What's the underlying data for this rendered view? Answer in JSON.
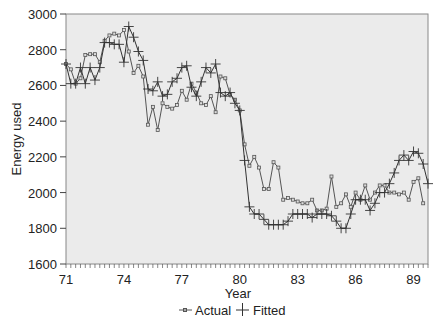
{
  "chart_data": {
    "type": "line",
    "title": "",
    "xlabel": "Year",
    "ylabel": "Energy used",
    "xlim": [
      71,
      89.75
    ],
    "ylim": [
      1600,
      3000
    ],
    "x_ticks": [
      "71",
      "74",
      "77",
      "80",
      "83",
      "86",
      "89"
    ],
    "x_tick_values": [
      71,
      74,
      77,
      80,
      83,
      86,
      89
    ],
    "y_ticks": [
      "1600",
      "1800",
      "2000",
      "2200",
      "2400",
      "2600",
      "2800",
      "3000"
    ],
    "y_tick_values": [
      1600,
      1800,
      2000,
      2200,
      2400,
      2600,
      2800,
      3000
    ],
    "grid": false,
    "legend_position": "bottom",
    "x_start": 71,
    "x_step": 0.25,
    "series": [
      {
        "name": "Actual",
        "marker": "square",
        "color": "#555555",
        "values": [
          2720,
          2690,
          2610,
          2640,
          2770,
          2775,
          2775,
          2730,
          2850,
          2880,
          2890,
          2880,
          2910,
          2790,
          2670,
          2710,
          2650,
          2380,
          2480,
          2350,
          2500,
          2480,
          2470,
          2490,
          2570,
          2520,
          2610,
          2560,
          2500,
          2490,
          2540,
          2450,
          2650,
          2640,
          2550,
          2520,
          2460,
          2270,
          2150,
          2200,
          2140,
          2020,
          2020,
          2170,
          2140,
          1960,
          1970,
          1960,
          1950,
          1940,
          1940,
          1960,
          1900,
          1900,
          1910,
          2090,
          1920,
          1940,
          1990,
          1920,
          2000,
          1960,
          2040,
          1960,
          2000,
          2040,
          2040,
          2000,
          2000,
          1990,
          2000,
          1960,
          2060,
          2080,
          1940
        ]
      },
      {
        "name": "Fitted",
        "marker": "plus",
        "color": "#333333",
        "values": [
          2720,
          2610,
          2610,
          2700,
          2610,
          2700,
          2630,
          2700,
          2840,
          2840,
          2830,
          2830,
          2730,
          2930,
          2870,
          2790,
          2740,
          2580,
          2570,
          2620,
          2540,
          2550,
          2620,
          2640,
          2700,
          2710,
          2590,
          2540,
          2620,
          2700,
          2670,
          2720,
          2560,
          2540,
          2560,
          2500,
          2460,
          2180,
          1920,
          1880,
          1880,
          1850,
          1820,
          1820,
          1820,
          1820,
          1840,
          1880,
          1880,
          1880,
          1880,
          1860,
          1880,
          1880,
          1880,
          1870,
          1840,
          1800,
          1800,
          1880,
          1960,
          1960,
          1960,
          1900,
          1940,
          2000,
          2000,
          2050,
          2110,
          2180,
          2210,
          2180,
          2230,
          2220,
          2160,
          2050
        ]
      }
    ]
  },
  "legend": {
    "items": [
      {
        "label": "Actual",
        "marker": "square"
      },
      {
        "label": "Fitted",
        "marker": "plus"
      }
    ]
  },
  "colors": {
    "plot_background": "#ebebeb",
    "axis": "#444444"
  }
}
